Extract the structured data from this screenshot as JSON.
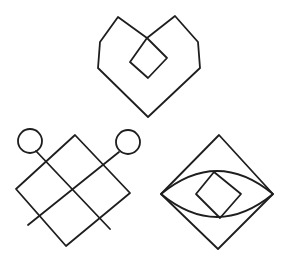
{
  "figure": {
    "background": "#ffffff",
    "ink_color": "#1e1e1e",
    "symbols": [
      {
        "name": "heart-with-diamond",
        "outline": [
          [
            118,
            17
          ],
          [
            100,
            42
          ],
          [
            98,
            68
          ],
          [
            148,
            117
          ],
          [
            200,
            68
          ],
          [
            198,
            42
          ],
          [
            175,
            16
          ],
          [
            147,
            38
          ],
          [
            118,
            17
          ]
        ],
        "crossing_lines": [
          [
            [
              118,
              17
            ],
            [
              167,
              58
            ]
          ],
          [
            [
              175,
              16
            ],
            [
              130,
              62
            ]
          ]
        ],
        "inner_diamond": [
          [
            147,
            38
          ],
          [
            167,
            58
          ],
          [
            148,
            78
          ],
          [
            130,
            62
          ]
        ]
      },
      {
        "name": "lattice-diamond-with-circles",
        "outer_diamond": [
          [
            75,
            135
          ],
          [
            16,
            189
          ],
          [
            66,
            246
          ],
          [
            130,
            193
          ]
        ],
        "circles": [
          {
            "cx": 30,
            "cy": 141,
            "r": 12
          },
          {
            "cx": 128,
            "cy": 142,
            "r": 12
          }
        ],
        "lines": [
          [
            [
              36,
              151
            ],
            [
              110,
              229
            ]
          ],
          [
            [
              118,
              152
            ],
            [
              28,
              225
            ]
          ],
          [
            [
              45,
              162
            ],
            [
              101,
              219
            ]
          ],
          [
            [
              103,
              162
            ],
            [
              40,
              218
            ]
          ]
        ]
      },
      {
        "name": "eye-in-diamond",
        "outer_diamond": [
          [
            219,
            135
          ],
          [
            161,
            194
          ],
          [
            218,
            249
          ],
          [
            273,
            194
          ]
        ],
        "lens": {
          "left": [
            161,
            194
          ],
          "right": [
            273,
            194
          ],
          "top_y": 171,
          "bottom_y": 218
        },
        "inner_diamond": [
          [
            214,
            172
          ],
          [
            241,
            194
          ],
          [
            220,
            218
          ],
          [
            196,
            194
          ]
        ]
      }
    ]
  }
}
